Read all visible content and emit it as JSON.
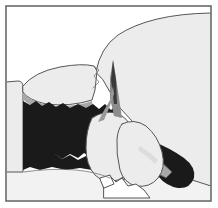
{
  "figure": {
    "caption": "",
    "width": 218,
    "height": 208,
    "background_color": "#ffffff"
  },
  "palette": {
    "background": "#ffffff",
    "light_gray": "#ececec",
    "pale_gray": "#e2e2e2",
    "medium_gray": "#a8a8a8",
    "dark_gray": "#8c8c8c",
    "black": "#1a1a1a",
    "outline": "#555555",
    "frame": "#6a6a6a"
  },
  "frame": {
    "label": "image-border",
    "x": 6,
    "y": 6,
    "width": 205,
    "height": 195,
    "stroke_width": 1.6
  },
  "regions": [
    {
      "id": "upper-right-mass",
      "label": "Large light-gray mass (upper right)",
      "fill": "#ececec",
      "tone": "light_gray"
    },
    {
      "id": "left-vertical-strip",
      "label": "Pale vertical strip (left edge)",
      "fill": "#ececec",
      "tone": "light_gray"
    },
    {
      "id": "upper-left-lens",
      "label": "Lens / oval body (upper left)",
      "fill": "#ececec",
      "tone": "light_gray"
    },
    {
      "id": "lens-gray-base",
      "label": "Medium gray base band under lens",
      "fill": "#a8a8a8",
      "tone": "medium_gray"
    },
    {
      "id": "central-black-mass",
      "label": "Irregular black mass (center left)",
      "fill": "#1a1a1a",
      "tone": "black"
    },
    {
      "id": "black-tail",
      "label": "Tapering black tail (right)",
      "fill": "#1a1a1a",
      "tone": "black"
    },
    {
      "id": "spike",
      "label": "Thin upward spike (center)",
      "fill": "#8c8c8c",
      "tone": "dark_gray"
    },
    {
      "id": "lower-left-lobe",
      "label": "Rounded light lobe (lower center-left)",
      "fill": "#ececec",
      "tone": "light_gray"
    },
    {
      "id": "lower-right-lobe",
      "label": "Rounded light lobe (lower center-right)",
      "fill": "#ececec",
      "tone": "light_gray"
    },
    {
      "id": "gray-band-right",
      "label": "Medium gray band (lower right)",
      "fill": "#a8a8a8",
      "tone": "medium_gray"
    },
    {
      "id": "bottom-basement",
      "label": "Pale basement area (bottom)",
      "fill": "#f2f2f2",
      "tone": "pale_gray"
    },
    {
      "id": "bottom-white-wedge",
      "label": "White wedge (bottom center)",
      "fill": "#ffffff",
      "tone": "background"
    }
  ],
  "labels": [],
  "annotations": []
}
